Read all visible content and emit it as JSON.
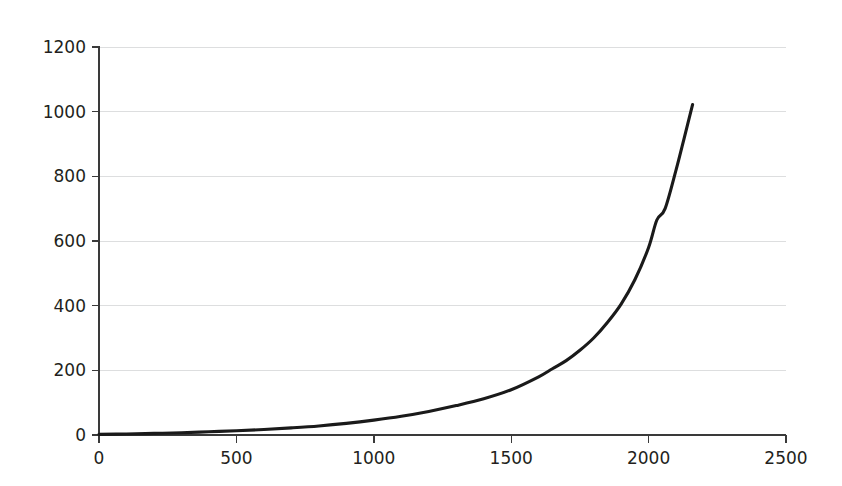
{
  "chart_data": {
    "type": "line",
    "title": "",
    "subtitle": "",
    "xlabel": "",
    "ylabel": "",
    "xlim": [
      0,
      2500
    ],
    "ylim": [
      0,
      1200
    ],
    "grid": "horizontal-only",
    "legend": "none",
    "background_color": "#ffffff",
    "line_color": "#1a1a1a",
    "grid_color": "#d9dadb",
    "axis_color": "#3a3a3a",
    "x_ticks": [
      0,
      500,
      1000,
      1500,
      2000,
      2500
    ],
    "x_tick_labels": [
      "0",
      "500",
      "1000",
      "1500",
      "2000",
      "2500"
    ],
    "y_ticks": [
      0,
      200,
      400,
      600,
      800,
      1000,
      1200
    ],
    "y_tick_labels": [
      "0",
      "200",
      "400",
      "600",
      "800",
      "1000",
      "1200"
    ],
    "series": [
      {
        "name": "curve",
        "x": [
          0,
          100,
          200,
          300,
          400,
          500,
          600,
          700,
          800,
          900,
          1000,
          1100,
          1200,
          1300,
          1400,
          1500,
          1600,
          1650,
          1700,
          1750,
          1800,
          1850,
          1900,
          1950,
          2000,
          2030,
          2060,
          2100,
          2130,
          2160
        ],
        "y": [
          2,
          3,
          5,
          7,
          10,
          13,
          17,
          22,
          28,
          36,
          46,
          58,
          73,
          91,
          112,
          140,
          180,
          205,
          230,
          262,
          300,
          348,
          405,
          480,
          580,
          665,
          700,
          820,
          920,
          1022
        ]
      }
    ],
    "annotations": []
  },
  "axes": {
    "y_axis_name": "value-axis",
    "x_axis_name": "index-axis"
  }
}
